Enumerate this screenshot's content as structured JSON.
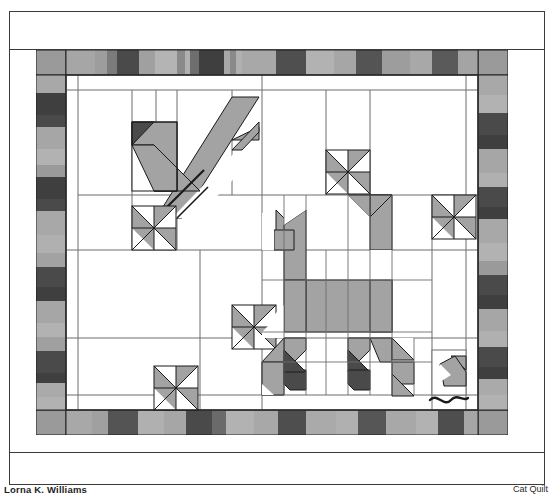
{
  "document": {
    "kind": "patent-style quilt drawing sheet",
    "caption_left": "Lorna K. Williams",
    "caption_right": "Cat Quilt",
    "frame_color": "#3b3b3b"
  },
  "palette": {
    "background": "#ffffff",
    "outline": "#1a1a1a",
    "patch_light": "#c9c9c9",
    "patch_mid": "#9a9a9a",
    "patch_dark": "#5a5a5a",
    "patch_darkest": "#3d3d3d",
    "seam": "#6d6d6d"
  },
  "quilt": {
    "title": "Cat quilt block layout",
    "border": {
      "name": "striped piano-key border",
      "corner_fill": "#9a9a9a",
      "top_strip_values": [
        "#9a9a9a",
        "#a6a6a6",
        "#7b7b7b",
        "#4a4a4a",
        "#a0a0a0",
        "#b4b4b4",
        "#8a8a8a",
        "#4a4a4a",
        "#3f3f3f",
        "#9b9b9b",
        "#a8a8a8",
        "#b0b0b0",
        "#9a9a9a",
        "#4f4f4f",
        "#a6a6a6",
        "#b2b2b2",
        "#545454",
        "#9d9d9d",
        "#a8a8a8",
        "#5a5a5a",
        "#a4a4a4",
        "#4e4e4e",
        "#a0a0a0",
        "#9a9a9a"
      ],
      "side_strip_values": [
        "#9a9a9a",
        "#a8a8a8",
        "#3f3f3f",
        "#4a4a4a",
        "#a6a6a6",
        "#b2b2b2",
        "#9a9a9a",
        "#3f3f3f",
        "#4a4a4a",
        "#a8a8a8",
        "#b0b0b0",
        "#a2a2a2",
        "#4a4a4a",
        "#3f3f3f",
        "#a6a6a6",
        "#b2b2b2",
        "#a0a0a0",
        "#4a4a4a",
        "#3f3f3f",
        "#aaaaaa",
        "#b2b2b2",
        "#9a9a9a",
        "#4a4a4a",
        "#3f3f3f",
        "#a8a8a8",
        "#b0b0b0"
      ],
      "bottom_strip_values": [
        "#9a9a9a",
        "#a8a8a8",
        "#545454",
        "#4a4a4a",
        "#b0b0b0",
        "#a6a6a6",
        "#4a4a4a",
        "#525252",
        "#b2b2b2",
        "#a8a8a8",
        "#4e4e4e",
        "#4a4a4a",
        "#aaaaaa",
        "#b0b0b0",
        "#565656",
        "#4a4a4a",
        "#a8a8a8",
        "#b2b2b2",
        "#4e4e4e",
        "#4a4a4a",
        "#a6a6a6",
        "#9a9a9a"
      ]
    },
    "motifs": [
      {
        "name": "bird-block",
        "label": "pieced bird with long wing",
        "position": "upper left"
      },
      {
        "name": "pinwheel-block-1",
        "label": "pinwheel",
        "position": "left upper-middle"
      },
      {
        "name": "pinwheel-block-2",
        "label": "pinwheel",
        "position": "top center"
      },
      {
        "name": "pinwheel-block-3",
        "label": "pinwheel",
        "position": "upper right"
      },
      {
        "name": "pinwheel-block-4",
        "label": "pinwheel",
        "position": "center"
      },
      {
        "name": "pinwheel-block-5",
        "label": "pinwheel",
        "position": "lower left"
      },
      {
        "name": "cat-block",
        "label": "large pieced cat, seated, facing right",
        "position": "center"
      },
      {
        "name": "mouse-block",
        "label": "pieced mouse with curled tail",
        "position": "lower right"
      }
    ]
  }
}
